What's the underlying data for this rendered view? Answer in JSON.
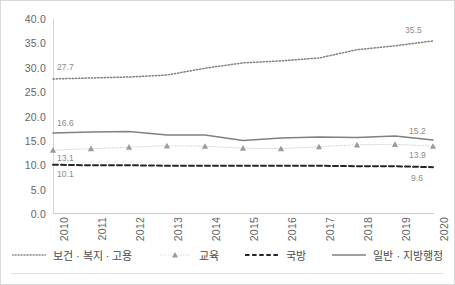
{
  "chart_data": {
    "type": "line",
    "title": "",
    "subtitle": "",
    "xlabel": "",
    "ylabel": "",
    "categories": [
      "2010",
      "2011",
      "2012",
      "2013",
      "2014",
      "2015",
      "2016",
      "2017",
      "2018",
      "2019",
      "2020"
    ],
    "ylim": [
      0.0,
      40.0
    ],
    "ytick_step": 5.0,
    "yticks": [
      "0.0",
      "5.0",
      "10.0",
      "15.0",
      "20.0",
      "25.0",
      "30.0",
      "35.0",
      "40.0"
    ],
    "grid": false,
    "legend_position": "bottom",
    "series": [
      {
        "name": "보건 · 복지 · 고용",
        "style": "dotted",
        "color": "#7f7f7f",
        "marker": "none",
        "values": [
          27.7,
          27.9,
          28.1,
          28.5,
          29.9,
          31.0,
          31.4,
          32.0,
          33.7,
          34.5,
          35.5
        ],
        "endpoint_labels": {
          "first": "27.7",
          "last": "35.5"
        }
      },
      {
        "name": "교육",
        "style": "dotted-thin",
        "color": "#a6a6a6",
        "marker": "triangle",
        "values": [
          13.1,
          13.4,
          13.7,
          14.0,
          13.9,
          13.5,
          13.4,
          13.8,
          14.2,
          14.3,
          13.9
        ],
        "endpoint_labels": {
          "first": "13.1",
          "last": "13.9"
        }
      },
      {
        "name": "국방",
        "style": "dashed",
        "color": "#262626",
        "marker": "none",
        "values": [
          10.1,
          10.0,
          10.0,
          9.9,
          9.9,
          9.9,
          9.9,
          9.9,
          9.8,
          9.8,
          9.6
        ],
        "endpoint_labels": {
          "first": "10.1",
          "last": "9.6"
        }
      },
      {
        "name": "일반 · 지방행정",
        "style": "solid",
        "color": "#808080",
        "marker": "none",
        "values": [
          16.6,
          16.8,
          16.9,
          16.2,
          16.2,
          15.1,
          15.6,
          15.8,
          15.7,
          16.0,
          15.2
        ],
        "endpoint_labels": {
          "first": "16.6",
          "last": "15.2"
        }
      }
    ]
  },
  "axis": {
    "y": {
      "t0": "0.0",
      "t1": "5.0",
      "t2": "10.0",
      "t3": "15.0",
      "t4": "20.0",
      "t5": "25.0",
      "t6": "30.0",
      "t7": "35.0",
      "t8": "40.0"
    },
    "x": {
      "t0": "2010",
      "t1": "2011",
      "t2": "2012",
      "t3": "2013",
      "t4": "2014",
      "t5": "2015",
      "t6": "2016",
      "t7": "2017",
      "t8": "2018",
      "t9": "2019",
      "t10": "2020"
    }
  },
  "labels": {
    "health_first": "27.7",
    "health_last": "35.5",
    "admin_first": "16.6",
    "admin_last": "15.2",
    "edu_first": "13.1",
    "edu_last": "13.9",
    "defense_first": "10.1",
    "defense_last": "9.6"
  },
  "legend": {
    "items": [
      {
        "label": "보건 · 복지 · 고용"
      },
      {
        "label": "교육"
      },
      {
        "label": "국방"
      },
      {
        "label": "일반 · 지방행정"
      }
    ]
  }
}
